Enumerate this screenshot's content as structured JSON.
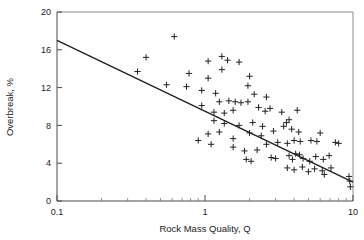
{
  "chart_data": {
    "type": "scatter",
    "title": "",
    "xlabel": "Rock Mass Quality, Q",
    "ylabel": "Overbreak, %",
    "xscale": "log",
    "yscale": "linear",
    "xlim": [
      0.1,
      10
    ],
    "ylim": [
      0,
      20
    ],
    "xticks": [
      0.1,
      1,
      10
    ],
    "xtick_labels": [
      "0.1",
      "1",
      "10"
    ],
    "yticks": [
      0,
      4,
      8,
      12,
      16,
      20
    ],
    "ytick_labels": [
      "0",
      "4",
      "8",
      "12",
      "16",
      "20"
    ],
    "grid": false,
    "legend": null,
    "marker": "plus",
    "series": [
      {
        "name": "Overbreak measurements",
        "points": [
          [
            0.62,
            17.4
          ],
          [
            0.4,
            15.2
          ],
          [
            0.35,
            13.7
          ],
          [
            0.55,
            12.3
          ],
          [
            0.78,
            13.5
          ],
          [
            0.75,
            12.1
          ],
          [
            1.05,
            14.8
          ],
          [
            1.05,
            13.0
          ],
          [
            0.95,
            11.7
          ],
          [
            1.18,
            11.4
          ],
          [
            1.3,
            15.3
          ],
          [
            1.42,
            14.9
          ],
          [
            1.7,
            14.7
          ],
          [
            1.3,
            13.9
          ],
          [
            2.0,
            13.2
          ],
          [
            1.25,
            10.5
          ],
          [
            0.95,
            10.1
          ],
          [
            1.45,
            10.6
          ],
          [
            1.6,
            10.5
          ],
          [
            1.75,
            10.4
          ],
          [
            1.95,
            10.5
          ],
          [
            1.15,
            9.4
          ],
          [
            1.35,
            9.3
          ],
          [
            1.55,
            9.6
          ],
          [
            2.3,
            9.9
          ],
          [
            2.55,
            9.5
          ],
          [
            2.75,
            9.8
          ],
          [
            3.3,
            9.4
          ],
          [
            4.2,
            9.6
          ],
          [
            1.15,
            8.5
          ],
          [
            1.35,
            8.2
          ],
          [
            1.7,
            8.0
          ],
          [
            2.1,
            8.3
          ],
          [
            2.45,
            7.9
          ],
          [
            1.05,
            7.1
          ],
          [
            1.25,
            7.3
          ],
          [
            1.55,
            6.6
          ],
          [
            2.0,
            7.2
          ],
          [
            2.4,
            6.9
          ],
          [
            2.9,
            7.4
          ],
          [
            3.4,
            7.9
          ],
          [
            3.55,
            8.3
          ],
          [
            3.7,
            8.6
          ],
          [
            3.85,
            7.6
          ],
          [
            4.3,
            7.3
          ],
          [
            1.55,
            5.7
          ],
          [
            1.85,
            5.3
          ],
          [
            2.25,
            5.4
          ],
          [
            2.6,
            6.0
          ],
          [
            3.1,
            6.2
          ],
          [
            3.6,
            6.1
          ],
          [
            4.0,
            6.4
          ],
          [
            4.4,
            6.3
          ],
          [
            5.2,
            6.4
          ],
          [
            5.7,
            6.3
          ],
          [
            1.9,
            4.4
          ],
          [
            2.05,
            4.2
          ],
          [
            2.8,
            4.6
          ],
          [
            3.0,
            4.5
          ],
          [
            3.7,
            4.8
          ],
          [
            3.9,
            4.4
          ],
          [
            4.1,
            5.0
          ],
          [
            4.35,
            4.9
          ],
          [
            4.6,
            4.5
          ],
          [
            5.1,
            4.2
          ],
          [
            5.6,
            4.7
          ],
          [
            6.3,
            4.4
          ],
          [
            6.9,
            4.8
          ],
          [
            3.6,
            3.5
          ],
          [
            4.0,
            3.3
          ],
          [
            4.55,
            3.6
          ],
          [
            5.0,
            3.1
          ],
          [
            5.5,
            3.4
          ],
          [
            6.2,
            3.2
          ],
          [
            7.1,
            3.5
          ],
          [
            9.4,
            2.6
          ],
          [
            9.5,
            2.1
          ],
          [
            9.6,
            1.5
          ],
          [
            6.4,
            2.8
          ],
          [
            0.9,
            6.4
          ],
          [
            1.1,
            6.0
          ],
          [
            2.15,
            11.3
          ],
          [
            2.6,
            11.0
          ],
          [
            1.95,
            12.2
          ],
          [
            6.0,
            7.2
          ],
          [
            7.6,
            6.2
          ],
          [
            8.0,
            6.1
          ]
        ]
      }
    ],
    "trendline": {
      "name": "log-linear regression",
      "x_start": 0.1,
      "y_start": 17.0,
      "x_end": 10,
      "y_end": 2.0
    }
  }
}
